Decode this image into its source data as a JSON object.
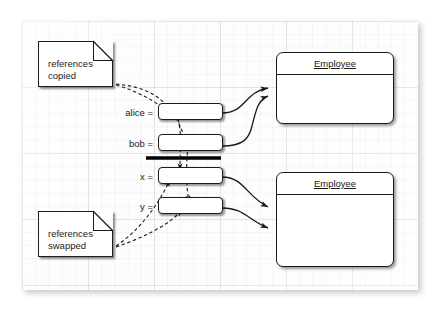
{
  "diagram": {
    "canvas_style": "graph-paper",
    "notes": [
      {
        "id": "copied",
        "text": "references\ncopied",
        "name": "note-references-copied"
      },
      {
        "id": "swapped",
        "text": "references\nswapped",
        "name": "note-references-swapped"
      }
    ],
    "variables": [
      {
        "id": "alice",
        "label": "alice ="
      },
      {
        "id": "bob",
        "label": "bob ="
      },
      {
        "id": "x",
        "label": "x ="
      },
      {
        "id": "y",
        "label": "y ="
      }
    ],
    "objects": [
      {
        "id": "employee-top",
        "title": "Employee"
      },
      {
        "id": "employee-bottom",
        "title": "Employee"
      }
    ],
    "connectors": {
      "reference_arrows": 4,
      "note_arrows": 4,
      "swap_divider": true
    },
    "colors": {
      "stroke": "#1b1b1b",
      "fill": "#ffffff",
      "grid_minor": "#c3c9d2",
      "grid_major": "#a5acb6",
      "canvas": "#fdfdfd"
    }
  }
}
